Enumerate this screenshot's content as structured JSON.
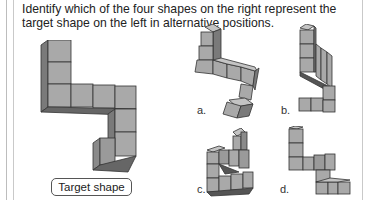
{
  "question": {
    "text": "Identify which of the four shapes on the right represent the target shape on the left in alternative positions."
  },
  "target": {
    "label": "Target shape",
    "icon": "cube-assembly-target"
  },
  "options": [
    {
      "label": "a.",
      "icon": "cube-assembly-a"
    },
    {
      "label": "b.",
      "icon": "cube-assembly-b"
    },
    {
      "label": "c.",
      "icon": "cube-assembly-c"
    },
    {
      "label": "d.",
      "icon": "cube-assembly-d"
    }
  ],
  "colors": {
    "cube_face": "#a9a9a9",
    "cube_side": "#7a7a7a",
    "cube_top": "#c4c4c4",
    "edge": "#333333"
  }
}
